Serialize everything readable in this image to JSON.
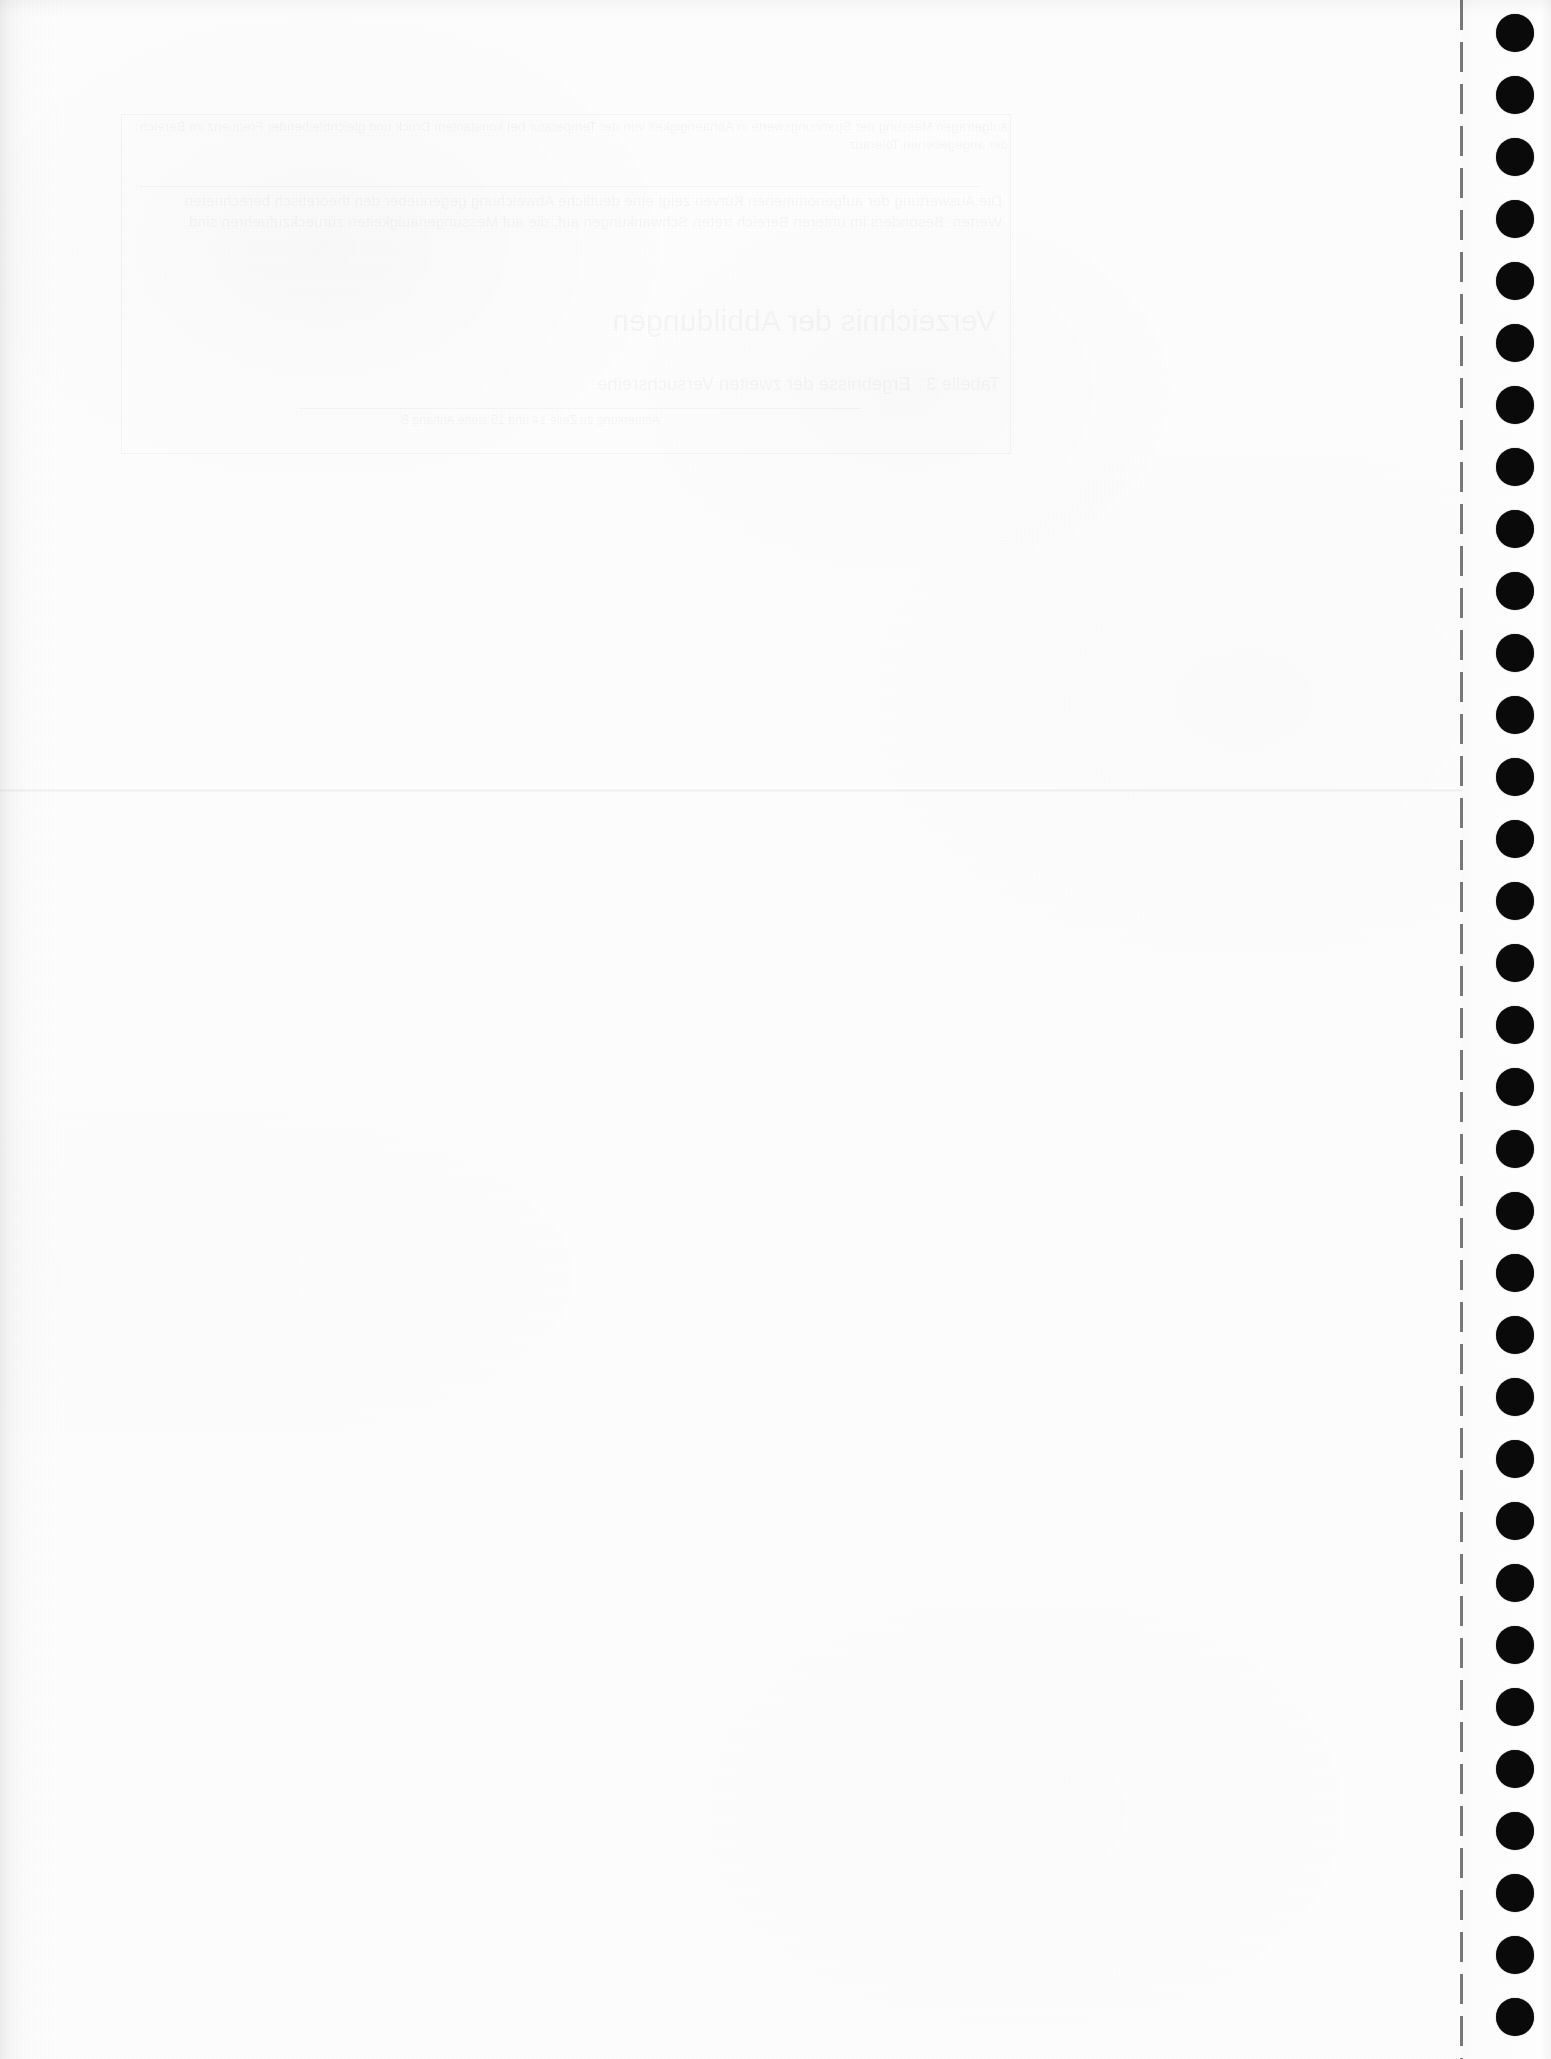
{
  "document": {
    "kind": "scanned-continuous-feed-paper",
    "page_width": 1551,
    "page_height": 2059,
    "paper_color": "#fdfdfd",
    "ink_color": "#0a0a0a"
  },
  "paper": {
    "body_width": 1462,
    "left_scan_shadow": true
  },
  "fold": {
    "label": "horizontal fold crease",
    "y": 789
  },
  "perforation": {
    "label": "tear-off perforation line",
    "x": 1460,
    "dash_length": 30,
    "gap_length": 12
  },
  "sprocket_strip": {
    "label": "pin-feed sprocket strip",
    "x": 1462,
    "width": 89,
    "hole_diameter": 38,
    "hole_pitch": 62,
    "hole_center_x": 1515,
    "first_hole_center_y": 33,
    "hole_count": 34
  },
  "show_through": {
    "label": "show-through text bleeding from the reverse side of the sheet",
    "legible": false,
    "region": {
      "x": 120,
      "y": 112,
      "width": 890,
      "height": 340
    },
    "frame": {
      "x": 121,
      "y": 114,
      "width": 888,
      "height": 338
    },
    "rules": [
      {
        "x": 140,
        "y": 186,
        "width": 840
      },
      {
        "x": 300,
        "y": 408,
        "width": 560
      }
    ],
    "blocks": [
      {
        "x": 128,
        "y": 118,
        "width": 880,
        "height": 64,
        "size": 13,
        "text": "aufgetragen Messung der Spannungswerte in Abhaengigkeit von der Temperatur bei konstantem Druck und gleichbleibender Frequenz im Bereich der angegebenen Toleranz"
      },
      {
        "x": 132,
        "y": 190,
        "width": 870,
        "height": 120,
        "size": 15,
        "text": "Die Auswertung der aufgenommenen Kurven zeigt eine deutliche Abweichung gegenueber den theoretisch berechneten Werten. Besonders im unteren Bereich treten Schwankungen auf, die auf Messungenauigkeiten zurueckzufuehren sind."
      },
      {
        "x": 336,
        "y": 300,
        "width": 660,
        "height": 110,
        "size": 30,
        "text": "Verzeichnis der Abbildungen"
      },
      {
        "x": 300,
        "y": 372,
        "width": 700,
        "height": 80,
        "size": 18,
        "text": "Tabelle 3   Ergebnisse der zweiten Versuchsreihe"
      },
      {
        "x": 160,
        "y": 412,
        "width": 500,
        "height": 50,
        "size": 12,
        "text": "Anmerkung zu Zeile 14 und 15 siehe Anhang B"
      }
    ]
  },
  "artifacts": {
    "top_edge_shadow": true,
    "right_edge_shadow": true
  }
}
